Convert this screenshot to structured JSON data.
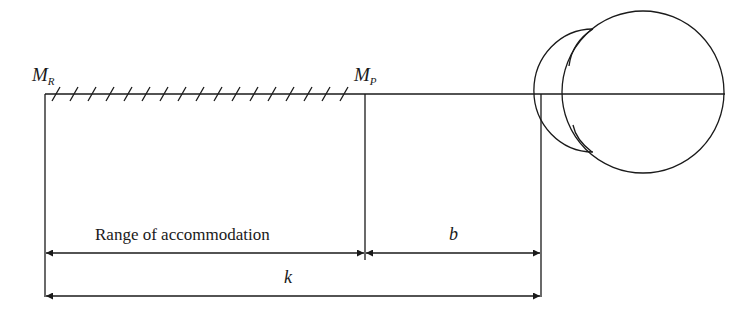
{
  "diagram": {
    "labels": {
      "far_point": {
        "main": "M",
        "sub": "R"
      },
      "near_point": {
        "main": "M",
        "sub": "P"
      },
      "range": "Range of accommodation",
      "b": "b",
      "k": "k"
    },
    "elements": {
      "hatch_count": 17,
      "eye": "eye-cross-section with cornea bulge",
      "stroke_color": "#1a1a1a"
    }
  }
}
